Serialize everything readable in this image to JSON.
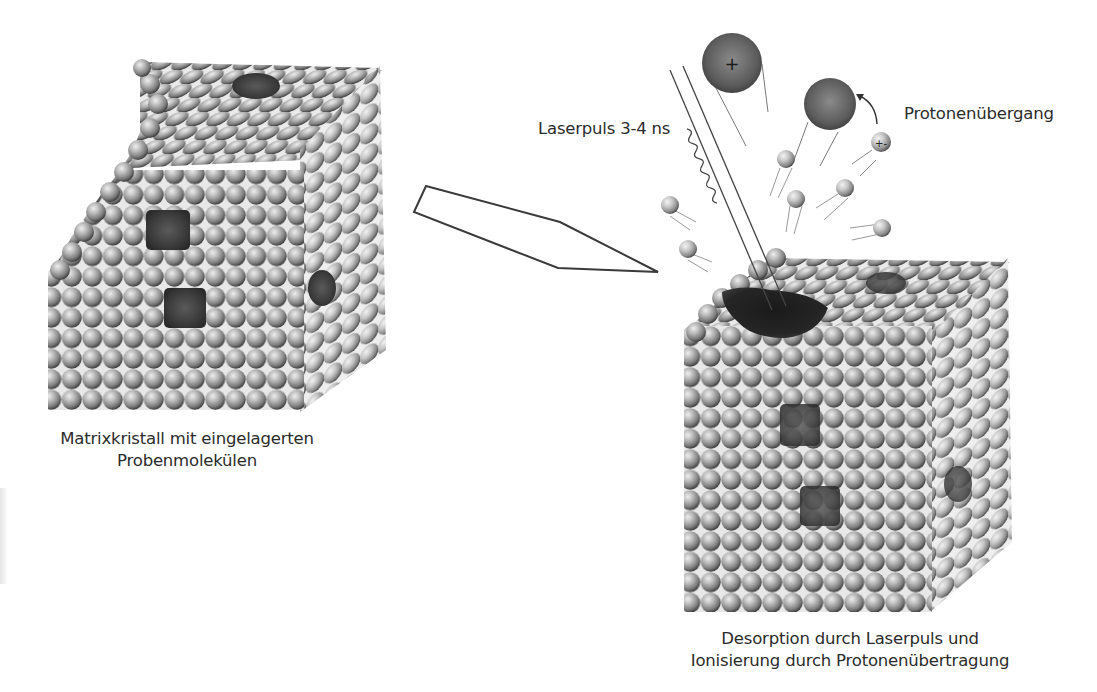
{
  "figure": {
    "left_panel": {
      "caption_line1": "Matrixkristall mit eingelagerten",
      "caption_line2": "Probenmolekülen",
      "crystal": {
        "rows": 15,
        "inclusions": 4
      }
    },
    "arrow": {
      "direction": "left-to-right",
      "style": "outlined-arrow"
    },
    "right_panel": {
      "laser_label": "Laserpuls 3-4 ns",
      "proton_label": "Protonenübergang",
      "caption_line1": "Desorption durch Laserpuls und",
      "caption_line2": "Ionisierung durch Protonenübertragung",
      "ion_charge_symbol": "+",
      "proton_symbol": "+-",
      "small_particles": 7,
      "large_ions": 2
    },
    "colors": {
      "sphere_light": "#d9d9d9",
      "sphere_mid": "#8f8f8f",
      "sphere_dark": "#3d3d3d",
      "inclusion": "#3a3a3a",
      "ion": "#5a5a5a",
      "text": "#2b2b2b"
    }
  }
}
